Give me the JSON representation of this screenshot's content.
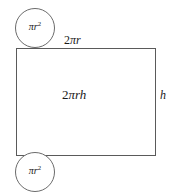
{
  "diagram": {
    "background_color": "#ffffff",
    "stroke_color": "#5a5a5a",
    "text_color": "#1a1a1a",
    "shapes": {
      "top_cap": {
        "name": "top-circle",
        "label_full": "πr²",
        "label_coefficient": "",
        "label_pi": "π",
        "label_variable": "r",
        "label_exponent": "2"
      },
      "bottom_cap": {
        "name": "bottom-circle",
        "label_full": "πr²",
        "label_coefficient": "",
        "label_pi": "π",
        "label_variable": "r",
        "label_exponent": "2"
      },
      "lateral": {
        "name": "rectangle",
        "area_label_full": "2πrh",
        "area_coefficient": "2",
        "area_pi": "π",
        "area_variables": "rh",
        "top_edge_label_full": "2πr",
        "top_edge_coefficient": "2",
        "top_edge_pi": "π",
        "top_edge_variable": "r",
        "right_edge_label": "h"
      }
    }
  }
}
